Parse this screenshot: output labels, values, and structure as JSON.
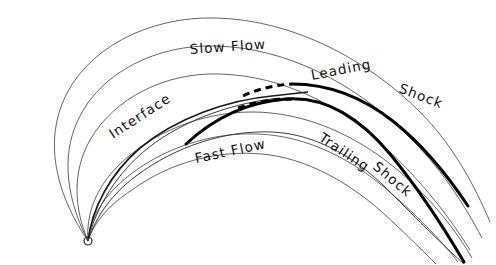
{
  "figure": {
    "background_color": "#ffffff",
    "ink_color": "#000000",
    "thin_line_color": "#4a4a4a",
    "width": 496,
    "height": 265
  },
  "labels": {
    "slow_flow": "Slow Flow",
    "fast_flow": "Fast Flow",
    "interface": "Interface",
    "leading": "Leading",
    "leading_shock": "Shock",
    "trailing": "Trailing",
    "trailing_shock": "Shock"
  },
  "origin": {
    "name": "source-point",
    "cx": 88,
    "cy": 241,
    "r": 4
  },
  "elements": {
    "thin_arcs_count": 7,
    "thick_shocks_count": 2,
    "dashed_segments_count": 2,
    "interface_curves_count": 1
  }
}
